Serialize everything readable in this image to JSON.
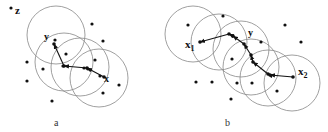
{
  "panels": [
    {
      "id": "a",
      "caption": "a",
      "labels": {
        "z": "z",
        "y": "y",
        "x": "x"
      },
      "circles": [
        {
          "cx": 56,
          "cy": 35,
          "r": 29
        },
        {
          "cx": 64,
          "cy": 62,
          "r": 29
        },
        {
          "cx": 80,
          "cy": 67,
          "r": 29
        },
        {
          "cx": 99,
          "cy": 78,
          "r": 29
        }
      ],
      "points": [
        {
          "x": 11,
          "y": 8
        },
        {
          "x": 92,
          "y": 24
        },
        {
          "x": 103,
          "y": 41
        },
        {
          "x": 55,
          "y": 40
        },
        {
          "x": 66,
          "y": 54
        },
        {
          "x": 27,
          "y": 62
        },
        {
          "x": 43,
          "y": 69
        },
        {
          "x": 95,
          "y": 60
        },
        {
          "x": 27,
          "y": 81
        },
        {
          "x": 119,
          "y": 85
        },
        {
          "x": 103,
          "y": 93
        },
        {
          "x": 52,
          "y": 101
        },
        {
          "x": 63,
          "y": 66
        },
        {
          "x": 84,
          "y": 68
        },
        {
          "x": 88,
          "y": 69
        },
        {
          "x": 100,
          "y": 76
        }
      ],
      "path": [
        {
          "x": 54,
          "y": 44
        },
        {
          "x": 64,
          "y": 66
        },
        {
          "x": 87,
          "y": 68
        },
        {
          "x": 104,
          "y": 77
        }
      ]
    },
    {
      "id": "b",
      "caption": "b",
      "labels": {
        "x1": "x",
        "x1_sub": "1",
        "y": "y",
        "x2": "x",
        "x2_sub": "2"
      },
      "circles": [
        {
          "cx": 193,
          "cy": 34,
          "r": 28
        },
        {
          "cx": 219,
          "cy": 42,
          "r": 28
        },
        {
          "cx": 241,
          "cy": 49,
          "r": 28
        },
        {
          "cx": 251,
          "cy": 67,
          "r": 28
        },
        {
          "cx": 268,
          "cy": 78,
          "r": 28
        },
        {
          "cx": 292,
          "cy": 83,
          "r": 28
        }
      ],
      "points": [
        {
          "x": 188,
          "y": 25
        },
        {
          "x": 223,
          "y": 16
        },
        {
          "x": 285,
          "y": 25
        },
        {
          "x": 301,
          "y": 42
        },
        {
          "x": 261,
          "y": 42
        },
        {
          "x": 232,
          "y": 59
        },
        {
          "x": 196,
          "y": 82
        },
        {
          "x": 212,
          "y": 82
        },
        {
          "x": 237,
          "y": 83
        },
        {
          "x": 252,
          "y": 83
        },
        {
          "x": 277,
          "y": 91
        },
        {
          "x": 231,
          "y": 99
        }
      ],
      "path": [
        {
          "x": 200,
          "y": 42
        },
        {
          "x": 229,
          "y": 34
        },
        {
          "x": 233,
          "y": 36
        },
        {
          "x": 244,
          "y": 44
        },
        {
          "x": 251,
          "y": 55
        },
        {
          "x": 253,
          "y": 62
        },
        {
          "x": 268,
          "y": 74
        },
        {
          "x": 270,
          "y": 75
        },
        {
          "x": 293,
          "y": 77
        }
      ]
    }
  ],
  "colors": {
    "circle_stroke": "#888888",
    "point_fill": "#111111",
    "background": "#ffffff"
  }
}
